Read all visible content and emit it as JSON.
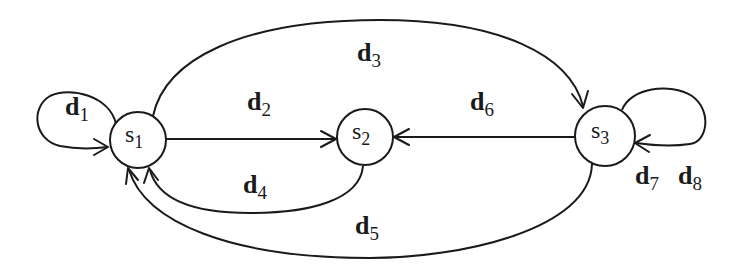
{
  "diagram": {
    "type": "state-transition-graph",
    "nodes": [
      {
        "id": "s1",
        "base": "s",
        "sub": "1"
      },
      {
        "id": "s2",
        "base": "s",
        "sub": "2"
      },
      {
        "id": "s3",
        "base": "s",
        "sub": "3"
      }
    ],
    "edges": [
      {
        "id": "d1",
        "base": "d",
        "sub": "1",
        "from": "s1",
        "to": "s1"
      },
      {
        "id": "d2",
        "base": "d",
        "sub": "2",
        "from": "s1",
        "to": "s2"
      },
      {
        "id": "d3",
        "base": "d",
        "sub": "3",
        "from": "s1",
        "to": "s3"
      },
      {
        "id": "d4",
        "base": "d",
        "sub": "4",
        "from": "s2",
        "to": "s1"
      },
      {
        "id": "d5",
        "base": "d",
        "sub": "5",
        "from": "s3",
        "to": "s1"
      },
      {
        "id": "d6",
        "base": "d",
        "sub": "6",
        "from": "s3",
        "to": "s2"
      },
      {
        "id": "d7",
        "base": "d",
        "sub": "7",
        "from": "s3",
        "to": "s3"
      },
      {
        "id": "d8",
        "base": "d",
        "sub": "8",
        "from": "s3",
        "to": "s3"
      }
    ],
    "colors": {
      "stroke": "#1a1a1a",
      "background": "#ffffff"
    }
  }
}
